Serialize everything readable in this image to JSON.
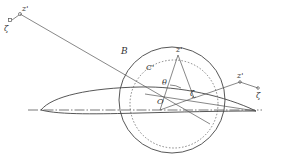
{
  "diagram": {
    "type": "conformal-mapping-airfoil",
    "labels": {
      "z_prime_top_left": "z'",
      "zeta_top_left": "ζ",
      "circle_B": "B",
      "circle_C": "C'",
      "theta": "θ",
      "origin": "O",
      "z_prime_circle": "z'",
      "zeta_circle": "ζ",
      "z_prime_right": "z'",
      "zeta_right": "ζ"
    },
    "elements": [
      "circle B (solid)",
      "circle C' (dotted)",
      "airfoil profile",
      "dash-dot chord axis",
      "radial lines from O"
    ]
  }
}
